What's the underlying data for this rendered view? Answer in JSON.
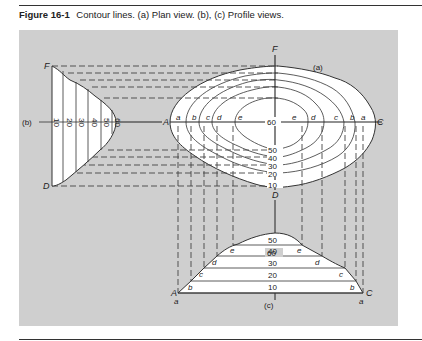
{
  "caption": {
    "figure_number": "Figure 16-1",
    "text": "Contour lines. (a) Plan view. (b), (c) Profile views."
  },
  "plan_view": {
    "label": "(a)",
    "axis_points": {
      "top": "F",
      "bottom": "D",
      "left": "A",
      "right": "C"
    },
    "center_value": "60",
    "contour_labels_left": [
      "a",
      "b",
      "c",
      "d",
      "e"
    ],
    "contour_labels_right": [
      "e",
      "d",
      "c",
      "b",
      "a"
    ],
    "elevation_labels": [
      "50",
      "40",
      "30",
      "20",
      "10"
    ]
  },
  "profile_b": {
    "label": "(b)",
    "end_points": {
      "top": "F",
      "bottom": "D"
    },
    "elevations": [
      "10",
      "20",
      "30",
      "40",
      "50",
      "60"
    ]
  },
  "profile_c": {
    "label": "(c)",
    "end_points": {
      "left": "A",
      "right": "C"
    },
    "elevations": [
      "60",
      "50",
      "40",
      "30",
      "20",
      "10"
    ],
    "left_labels": [
      "a",
      "b",
      "c",
      "d",
      "e"
    ],
    "right_labels": [
      "e",
      "d",
      "c",
      "b",
      "a"
    ]
  },
  "colors": {
    "panel_background": "#cfcfcf",
    "fill": "#ffffff",
    "line": "#333333"
  }
}
